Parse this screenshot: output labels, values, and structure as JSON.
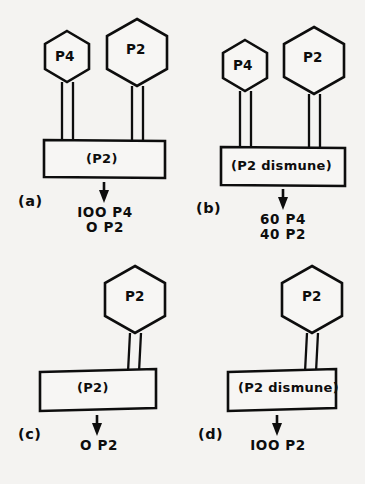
{
  "figure": {
    "background_color": "#f4f3f1",
    "ink_color": "#0d0d0d",
    "panels": [
      {
        "id": "a",
        "letter": "(a)",
        "capsids": [
          {
            "name": "P4",
            "label": "P4",
            "size": "small"
          },
          {
            "name": "P2",
            "label": "P2",
            "size": "large"
          }
        ],
        "box_label": "(P2)",
        "arrow": "down-arrow",
        "yield_lines": [
          "IOO P4",
          "O P2"
        ],
        "yield_values": [
          {
            "count": "IOO",
            "particle": "P4"
          },
          {
            "count": "O",
            "particle": "P2"
          }
        ]
      },
      {
        "id": "b",
        "letter": "(b)",
        "capsids": [
          {
            "name": "P4",
            "label": "P4",
            "size": "small"
          },
          {
            "name": "P2",
            "label": "P2",
            "size": "large"
          }
        ],
        "box_label": "(P2 dismune)",
        "arrow": "down-arrow",
        "yield_lines": [
          "60 P4",
          "40 P2"
        ],
        "yield_values": [
          {
            "count": "60",
            "particle": "P4"
          },
          {
            "count": "40",
            "particle": "P2"
          }
        ]
      },
      {
        "id": "c",
        "letter": "(c)",
        "capsids": [
          {
            "name": "P2",
            "label": "P2",
            "size": "large"
          }
        ],
        "box_label": "(P2)",
        "arrow": "down-arrow",
        "yield_lines": [
          "O P2"
        ],
        "yield_values": [
          {
            "count": "O",
            "particle": "P2"
          }
        ]
      },
      {
        "id": "d",
        "letter": "(d)",
        "capsids": [
          {
            "name": "P2",
            "label": "P2",
            "size": "large"
          }
        ],
        "box_label": "(P2 dismune)",
        "arrow": "down-arrow",
        "yield_lines": [
          "IOO P2"
        ],
        "yield_values": [
          {
            "count": "IOO",
            "particle": "P2"
          }
        ]
      }
    ]
  }
}
